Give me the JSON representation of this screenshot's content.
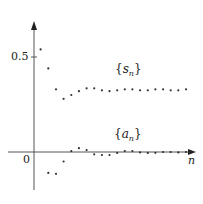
{
  "chart_data": {
    "type": "scatter",
    "title": "",
    "xlabel": "n",
    "ylabel": "",
    "origin_label": "0",
    "yticks": [
      {
        "value": 0.5,
        "label": "0.5"
      }
    ],
    "ylim": [
      -0.2,
      0.7
    ],
    "xlim": [
      -3,
      21
    ],
    "grid": false,
    "legend": "inline labels",
    "series": [
      {
        "name": "{s_n}",
        "label_main": "s",
        "label_sub": "n",
        "x": [
          1,
          2,
          3,
          4,
          5,
          6,
          7,
          8,
          9,
          10,
          11,
          12,
          13,
          14,
          15,
          16,
          17,
          18,
          19,
          20
        ],
        "values": [
          0.54,
          0.44,
          0.33,
          0.28,
          0.3,
          0.32,
          0.335,
          0.335,
          0.325,
          0.32,
          0.325,
          0.33,
          0.33,
          0.325,
          0.325,
          0.33,
          0.33,
          0.325,
          0.325,
          0.33
        ]
      },
      {
        "name": "{a_n}",
        "label_main": "a",
        "label_sub": "n",
        "x": [
          2,
          3,
          4,
          5,
          6,
          7,
          8,
          9,
          10,
          11,
          12,
          13,
          14,
          15,
          16,
          17,
          18,
          19,
          20
        ],
        "values": [
          -0.11,
          -0.115,
          -0.05,
          0.005,
          0.02,
          0.01,
          -0.012,
          -0.016,
          -0.016,
          -0.005,
          0.005,
          0.005,
          -0.002,
          -0.005,
          -0.004,
          0.0,
          0.0,
          -0.002,
          0.0
        ]
      }
    ]
  }
}
